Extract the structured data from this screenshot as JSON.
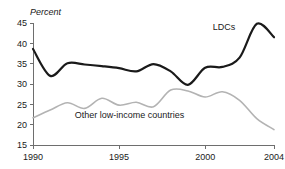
{
  "chart_data": {
    "type": "line",
    "title": "",
    "subtitle": "",
    "xlabel": "",
    "ylabel": "Percent",
    "ylim": [
      15,
      45
    ],
    "xlim": [
      1990,
      2004
    ],
    "grid": false,
    "legend_position": "inline-annotation",
    "y_ticks": [
      15,
      20,
      25,
      30,
      35,
      40,
      45
    ],
    "y_tick_labels": [
      "15",
      "20",
      "25",
      "30",
      "35",
      "40",
      "45"
    ],
    "x_ticks": [
      1990,
      1995,
      2000,
      2004
    ],
    "x_tick_labels": [
      "1990",
      "1995",
      "2000",
      "2004"
    ],
    "x": [
      1990,
      1991,
      1992,
      1993,
      1994,
      1995,
      1996,
      1997,
      1998,
      1999,
      2000,
      2001,
      2002,
      2003,
      2004
    ],
    "series": [
      {
        "name": "LDCs",
        "color": "#1a1a1a",
        "width": 2.2,
        "label_x": 2001.1,
        "label_y": 43.2,
        "values": [
          38.6,
          32.0,
          35.1,
          34.8,
          34.4,
          33.9,
          33.1,
          34.9,
          33.1,
          29.8,
          34.0,
          34.2,
          36.5,
          44.8,
          41.5
        ]
      },
      {
        "name": "Other low-income countries",
        "color": "#b3b3b3",
        "width": 1.6,
        "label_x": 1995.6,
        "label_y": 21.6,
        "values": [
          21.7,
          23.6,
          25.4,
          24.0,
          26.5,
          24.8,
          25.5,
          24.4,
          28.5,
          28.3,
          26.8,
          28.1,
          26.0,
          21.5,
          18.8
        ]
      }
    ],
    "annotations": [
      {
        "text": "LDCs",
        "x": 2001.1,
        "y": 43.2
      },
      {
        "text": "Other low-income countries",
        "x": 1995.6,
        "y": 21.6
      }
    ]
  },
  "colors": {
    "background": "#ffffff",
    "axis": "#6e6e6e",
    "text": "#1a1a1a",
    "series_ldcs": "#1a1a1a",
    "series_other": "#b3b3b3"
  }
}
